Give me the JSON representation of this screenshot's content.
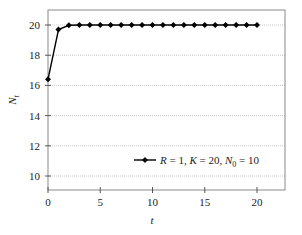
{
  "chart_data": {
    "type": "line",
    "title": "",
    "xlabel": "t",
    "ylabel": "N_t",
    "xlim": [
      0,
      22.8
    ],
    "ylim": [
      9,
      21
    ],
    "xticks": [
      0,
      5,
      10,
      15,
      20
    ],
    "yticks": [
      10,
      12,
      14,
      16,
      18,
      20
    ],
    "grid": {
      "y": true,
      "x": false
    },
    "legend_position": "lower right",
    "series": [
      {
        "name": "R = 1, K = 20, N0 = 10",
        "marker": "diamond",
        "color": "#000000",
        "x": [
          0,
          1,
          2,
          3,
          4,
          5,
          6,
          7,
          8,
          9,
          10,
          11,
          12,
          13,
          14,
          15,
          16,
          17,
          18,
          19,
          20
        ],
        "y": [
          16.4,
          19.7,
          19.98,
          20,
          20,
          20,
          20,
          20,
          20,
          20,
          20,
          20,
          20,
          20,
          20,
          20,
          20,
          20,
          20,
          20,
          20
        ]
      }
    ]
  },
  "labels": {
    "xlabel": "t",
    "ylabel_main": "N",
    "ylabel_sub": "t",
    "legend": {
      "r_part": "R",
      "r_rest": " = 1, ",
      "k_part": "K",
      "k_rest": " = 20, ",
      "n_part": "N",
      "n_sub": "0",
      "n_rest": " = 10"
    }
  },
  "colors": {
    "line": "#000000",
    "grid": "#c8c8c8",
    "frame": "#8a8a8a"
  }
}
